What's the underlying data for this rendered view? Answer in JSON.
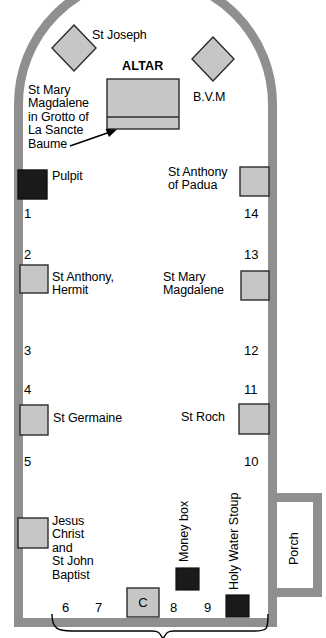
{
  "plan": {
    "title": "Church floor plan",
    "colors": {
      "wall": "#8f8f8f",
      "wall_stroke": "#6e6e6e",
      "fixture_light": "#c8c8c8",
      "fixture_dark": "#1a1a1a",
      "outline": "#2b2b2b",
      "background": "#ffffff"
    },
    "labels": {
      "st_joseph": "St Joseph",
      "altar": "ALTAR",
      "bvm": "B.V.M",
      "st_mary_magdalene_grotto": "St Mary\nMagdalene\nin Grotto of\nLa Sancte\nBaume",
      "pulpit": "Pulpit",
      "st_anthony_padua": "St Anthony\nof Padua",
      "st_anthony_hermit": "St Anthony,\nHermit",
      "st_mary_magdalene": "St Mary\nMagdalene",
      "st_germaine": "St Germaine",
      "st_roch": "St Roch",
      "jesus_st_john": "Jesus\nChrist\nand\nSt John\nBaptist",
      "money_box": "Money box",
      "holy_water_stoup": "Holy Water Stoup",
      "porch": "Porch",
      "confessional": "C"
    },
    "station_numbers": {
      "left": [
        "1",
        "2",
        "3",
        "4",
        "5",
        "6",
        "7"
      ],
      "right": [
        "14",
        "13",
        "12",
        "11",
        "10",
        "9",
        "8"
      ]
    },
    "numbers_bottom": [
      "6",
      "7",
      "8",
      "9"
    ],
    "fixtures": [
      {
        "name": "st-joseph-altar",
        "shape": "diamond",
        "fill": "light"
      },
      {
        "name": "bvm-altar",
        "shape": "diamond",
        "fill": "light"
      },
      {
        "name": "altar",
        "shape": "rect",
        "fill": "light"
      },
      {
        "name": "pulpit",
        "shape": "rect",
        "fill": "dark"
      },
      {
        "name": "st-anthony-padua-statue",
        "shape": "rect",
        "fill": "light"
      },
      {
        "name": "st-anthony-hermit-statue",
        "shape": "rect",
        "fill": "light"
      },
      {
        "name": "st-mary-magdalene-statue",
        "shape": "rect",
        "fill": "light"
      },
      {
        "name": "st-germaine-statue",
        "shape": "rect",
        "fill": "light"
      },
      {
        "name": "st-roch-statue",
        "shape": "rect",
        "fill": "light"
      },
      {
        "name": "jesus-st-john-statue",
        "shape": "rect",
        "fill": "light"
      },
      {
        "name": "confessional",
        "shape": "rect",
        "fill": "light"
      },
      {
        "name": "money-box",
        "shape": "rect",
        "fill": "dark"
      },
      {
        "name": "holy-water-stoup",
        "shape": "rect",
        "fill": "dark"
      }
    ]
  }
}
